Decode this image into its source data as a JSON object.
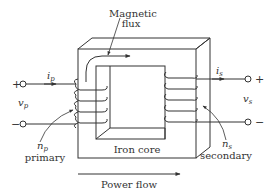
{
  "diagram": {
    "labels": {
      "magnetic_flux_line1": "Magnetic",
      "magnetic_flux_line2": "flux",
      "iron_core": "Iron core",
      "power_flow": "Power flow",
      "primary_turns_symbol": "n",
      "primary_turns_sub": "p",
      "primary": "primary",
      "secondary_turns_symbol": "n",
      "secondary_turns_sub": "s",
      "secondary": "secondary",
      "primary_current_symbol": "i",
      "primary_current_sub": "p",
      "secondary_current_symbol": "i",
      "secondary_current_sub": "s",
      "primary_voltage_symbol": "v",
      "primary_voltage_sub": "p",
      "secondary_voltage_symbol": "v",
      "secondary_voltage_sub": "s",
      "primary_plus": "+",
      "primary_minus": "−",
      "secondary_plus": "+",
      "secondary_minus": "−"
    },
    "colors": {
      "stroke": "#333333",
      "background": "#ffffff"
    }
  }
}
